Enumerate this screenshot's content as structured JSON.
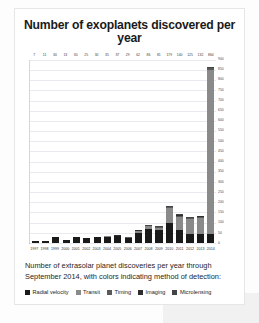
{
  "card": {
    "title": "Number of exoplanets discovered per year",
    "caption": "Number of extrasolar planet discoveries per year through September 2014, with colors indicating method of detection:"
  },
  "legend": [
    {
      "label": "Radial velocity",
      "color": "#1a1a1a"
    },
    {
      "label": "Transit",
      "color": "#8a8a8a"
    },
    {
      "label": "Timing",
      "color": "#5a5a5a"
    },
    {
      "label": "Imaging",
      "color": "#2e2e2e"
    },
    {
      "label": "Microlensing",
      "color": "#444444"
    }
  ],
  "chart_data": {
    "type": "bar",
    "title": "Number of exoplanets discovered per year",
    "xlabel": "",
    "ylabel": "",
    "ylim": [
      0,
      900
    ],
    "grid": true,
    "stacked": true,
    "legend_position": "below-caption",
    "categories": [
      "1997",
      "1998",
      "1999",
      "2000",
      "2001",
      "2002",
      "2003",
      "2004",
      "2005",
      "2006",
      "2007",
      "2008",
      "2009",
      "2010",
      "2011",
      "2012",
      "2013",
      "2014"
    ],
    "totals": [
      7,
      11,
      30,
      13,
      30,
      25,
      30,
      35,
      37,
      29,
      62,
      86,
      81,
      179,
      140,
      125,
      132,
      864
    ],
    "series": [
      {
        "name": "Radial velocity",
        "color": "#1a1a1a",
        "values": [
          7,
          10,
          27,
          13,
          27,
          24,
          27,
          31,
          32,
          23,
          50,
          68,
          62,
          98,
          61,
          43,
          45,
          46
        ]
      },
      {
        "name": "Transit",
        "color": "#8a8a8a",
        "values": [
          0,
          0,
          1,
          0,
          1,
          0,
          1,
          2,
          3,
          3,
          9,
          13,
          12,
          72,
          67,
          73,
          76,
          806
        ]
      },
      {
        "name": "Timing",
        "color": "#5a5a5a",
        "values": [
          0,
          1,
          1,
          0,
          1,
          0,
          1,
          0,
          1,
          1,
          1,
          2,
          3,
          4,
          6,
          4,
          5,
          6
        ]
      },
      {
        "name": "Imaging",
        "color": "#2e2e2e",
        "values": [
          0,
          0,
          1,
          0,
          1,
          1,
          1,
          1,
          1,
          1,
          1,
          2,
          3,
          3,
          4,
          3,
          4,
          4
        ]
      },
      {
        "name": "Microlensing",
        "color": "#444444",
        "values": [
          0,
          0,
          0,
          0,
          0,
          0,
          0,
          1,
          0,
          1,
          1,
          1,
          1,
          2,
          2,
          2,
          2,
          2
        ]
      }
    ],
    "data_labels": [
      "7",
      "11",
      "30",
      "13",
      "30",
      "25",
      "30",
      "35",
      "37",
      "29",
      "62",
      "86",
      "81",
      "179",
      "140",
      "125",
      "132",
      "864"
    ],
    "ytick_labels": [
      "900",
      "850",
      "800",
      "750",
      "700",
      "650",
      "600",
      "550",
      "500",
      "450",
      "400",
      "350",
      "300",
      "250",
      "200",
      "150",
      "100",
      "50",
      "0"
    ],
    "ytick_values": [
      900,
      850,
      800,
      750,
      700,
      650,
      600,
      550,
      500,
      450,
      400,
      350,
      300,
      250,
      200,
      150,
      100,
      50,
      0
    ]
  }
}
